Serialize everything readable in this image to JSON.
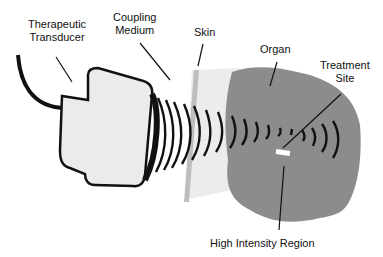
{
  "labels": {
    "transducer_line1": "Therapeutic",
    "transducer_line2": "Transducer",
    "coupling_line1": "Coupling",
    "coupling_line2": "Medium",
    "skin": "Skin",
    "organ": "Organ",
    "treatment_line1": "Treatment",
    "treatment_line2": "Site",
    "high_intensity": "High Intensity Region"
  },
  "colors": {
    "organ": "#8c8c8c",
    "transducer_fill": "#ebebeb",
    "coupling": "#e4e4e4",
    "skin": "#c8c8c8",
    "line": "#111111"
  }
}
